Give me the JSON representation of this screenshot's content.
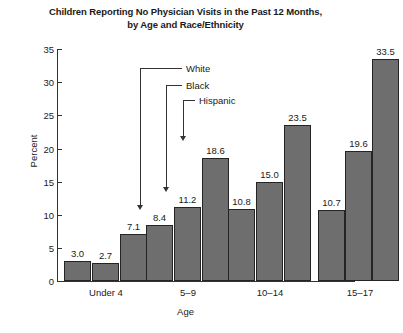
{
  "chart_data": {
    "type": "bar",
    "title": "Children Reporting No Physician Visits in the Past 12 Months, by Age and Race/Ethnicity",
    "title_line1": "Children Reporting No Physician Visits in the Past 12 Months,",
    "title_line2": "by Age and Race/Ethnicity",
    "xlabel": "Age",
    "ylabel": "Percent",
    "ylim": [
      0,
      35
    ],
    "yticks": [
      0,
      5,
      10,
      15,
      20,
      25,
      30,
      35
    ],
    "ytick_labels": [
      "0",
      "5",
      "10",
      "15",
      "20",
      "25",
      "30",
      "35"
    ],
    "grid": false,
    "legend_position": "inside-upper-center",
    "categories": [
      "Under 4",
      "5–9",
      "10–14",
      "15–17"
    ],
    "series": [
      {
        "name": "White",
        "values": [
          3.0,
          8.4,
          10.8,
          10.7
        ],
        "labels": [
          "3.0",
          "8.4",
          "10.8",
          "10.7"
        ],
        "color": "#6e6e6e"
      },
      {
        "name": "Black",
        "values": [
          2.7,
          11.2,
          15.0,
          19.6
        ],
        "labels": [
          "2.7",
          "11.2",
          "15.0",
          "19.6"
        ],
        "color": "#6e6e6e"
      },
      {
        "name": "Hispanic",
        "values": [
          7.1,
          18.6,
          23.5,
          33.5
        ],
        "labels": [
          "7.1",
          "18.6",
          "23.5",
          "33.5"
        ],
        "color": "#6e6e6e"
      }
    ],
    "annotations": [
      {
        "label": "White",
        "points_to": "5-9 White bar"
      },
      {
        "label": "Black",
        "points_to": "5-9 Black bar"
      },
      {
        "label": "Hispanic",
        "points_to": "5-9 Hispanic bar"
      }
    ]
  }
}
